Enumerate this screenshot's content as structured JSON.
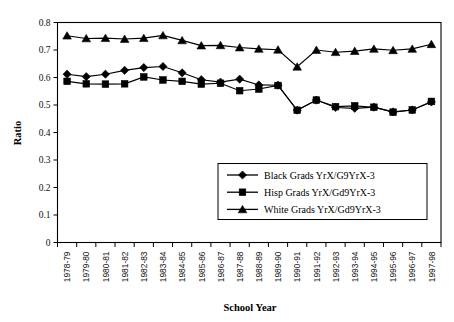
{
  "chart_data": {
    "type": "line",
    "title": "",
    "xlabel": "School Year",
    "ylabel": "Ratio",
    "ylim": [
      0,
      0.8
    ],
    "ytick_labels": [
      "0",
      "0.1",
      "0.2",
      "0.3",
      "0.4",
      "0.5",
      "0.6",
      "0.7",
      "0.8"
    ],
    "ytick_values": [
      0,
      0.1,
      0.2,
      0.3,
      0.4,
      0.5,
      0.6,
      0.7,
      0.8
    ],
    "grid": false,
    "legend_position": "center-right",
    "categories": [
      "1978-79",
      "1979-80",
      "1980-81",
      "1981-82",
      "1982-83",
      "1983-84",
      "1984-85",
      "1985-86",
      "1986-87",
      "1987-88",
      "1988-89",
      "1989-90",
      "1990-91",
      "1991-92",
      "1992-93",
      "1993-94",
      "1994-95",
      "1995-96",
      "1996-97",
      "1997-98"
    ],
    "series": [
      {
        "name": "Black Grads YrX/G9YrX-3",
        "marker": "diamond",
        "values": [
          0.612,
          0.603,
          0.612,
          0.626,
          0.636,
          0.64,
          0.617,
          0.592,
          0.583,
          0.594,
          0.573,
          0.572,
          0.481,
          0.518,
          0.491,
          0.488,
          0.492,
          0.475,
          0.482,
          0.511
        ]
      },
      {
        "name": "Hisp Grads YrX/Gd9YrX-3",
        "marker": "square",
        "values": [
          0.586,
          0.577,
          0.576,
          0.577,
          0.602,
          0.591,
          0.586,
          0.576,
          0.579,
          0.552,
          0.558,
          0.571,
          0.481,
          0.518,
          0.494,
          0.497,
          0.492,
          0.474,
          0.482,
          0.513
        ]
      },
      {
        "name": "White Grads YrX/Gd9YrX-3",
        "marker": "triangle",
        "values": [
          0.752,
          0.742,
          0.743,
          0.74,
          0.743,
          0.753,
          0.735,
          0.716,
          0.717,
          0.709,
          0.704,
          0.701,
          0.639,
          0.7,
          0.692,
          0.696,
          0.704,
          0.699,
          0.704,
          0.721
        ]
      }
    ]
  },
  "legend": {
    "entries": [
      {
        "label": "Black Grads YrX/G9YrX-3",
        "marker": "diamond-marker-icon"
      },
      {
        "label": "Hisp Grads YrX/Gd9YrX-3",
        "marker": "square-marker-icon"
      },
      {
        "label": "White Grads YrX/Gd9YrX-3",
        "marker": "triangle-marker-icon"
      }
    ]
  },
  "colors": {
    "series": "#000000",
    "axis": "#000000",
    "background": "#ffffff"
  }
}
